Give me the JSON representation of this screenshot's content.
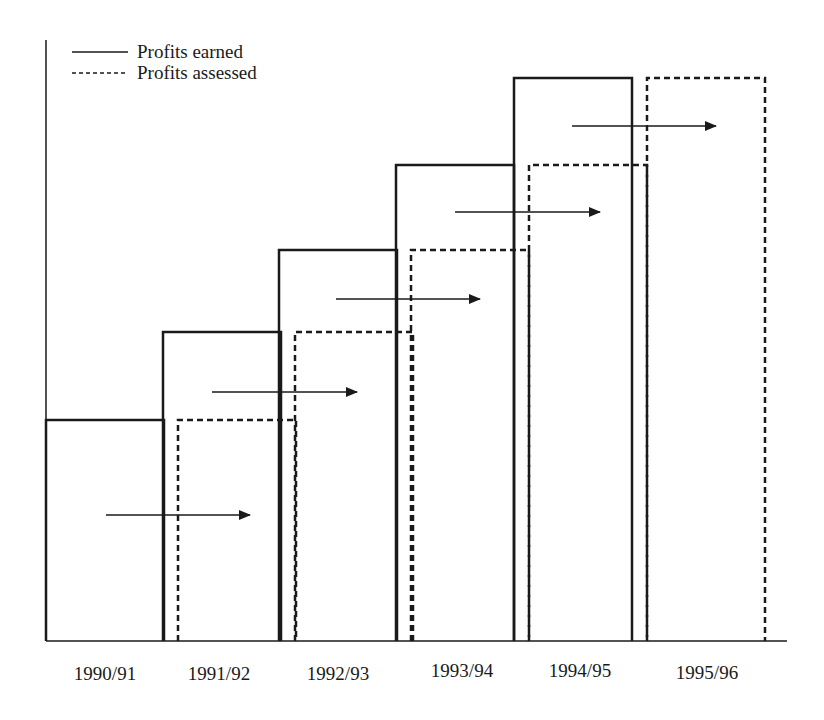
{
  "chart_data": {
    "type": "bar",
    "title": "",
    "xlabel": "",
    "ylabel": "",
    "categories": [
      "1990/91",
      "1991/92",
      "1992/93",
      "1993/94",
      "1994/95",
      "1995/96"
    ],
    "series": [
      {
        "name": "Profits earned",
        "style": "solid",
        "values": [
          221,
          309,
          391,
          476,
          563,
          null
        ]
      },
      {
        "name": "Profits assessed",
        "style": "dashed",
        "values": [
          null,
          221,
          309,
          391,
          476,
          563
        ]
      }
    ],
    "value_units": "relative height (no y-axis scale shown)",
    "ylim": [
      0,
      600
    ],
    "grid": false,
    "legend_position": "top-left",
    "annotations": [
      {
        "type": "arrow",
        "from_category": "1990/91",
        "to_category": "1991/92",
        "meaning": "profits earned in one year assessed in following year"
      },
      {
        "type": "arrow",
        "from_category": "1991/92",
        "to_category": "1992/93"
      },
      {
        "type": "arrow",
        "from_category": "1992/93",
        "to_category": "1993/94"
      },
      {
        "type": "arrow",
        "from_category": "1993/94",
        "to_category": "1994/95"
      },
      {
        "type": "arrow",
        "from_category": "1994/95",
        "to_category": "1995/96"
      }
    ]
  },
  "legend": {
    "earned_label": "Profits earned",
    "assessed_label": "Profits assessed"
  },
  "axis": {
    "ticks": [
      "1990/91",
      "1991/92",
      "1992/93",
      "1993/94",
      "1994/95",
      "1995/96"
    ]
  },
  "colors": {
    "line": "#1a1a1a",
    "background": "#ffffff"
  }
}
